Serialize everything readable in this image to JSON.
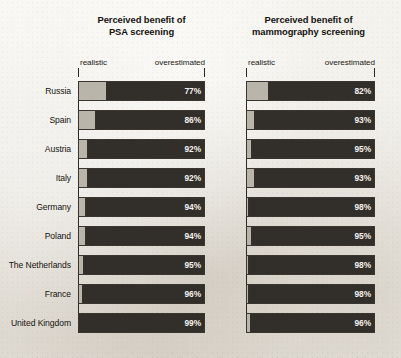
{
  "chart_data": {
    "type": "bar",
    "subtype": "paired horizontal 100% stacked bar",
    "title": "",
    "categories": [
      "Russia",
      "Spain",
      "Austria",
      "Italy",
      "Germany",
      "Poland",
      "The Netherlands",
      "France",
      "United Kingdom"
    ],
    "panels": [
      {
        "title_line1": "Perceived benefit of",
        "title_line2": "PSA screening",
        "left_axis_label": "realistic",
        "right_axis_label": "overestimated",
        "values": [
          77,
          86,
          92,
          92,
          94,
          94,
          95,
          96,
          99
        ],
        "value_labels": [
          "77%",
          "86%",
          "92%",
          "92%",
          "94%",
          "94%",
          "95%",
          "96%",
          "99%"
        ],
        "realistic_values": [
          23,
          14,
          8,
          8,
          6,
          6,
          5,
          4,
          1
        ]
      },
      {
        "title_line1": "Perceived benefit of",
        "title_line2": "mammography screening",
        "left_axis_label": "realistic",
        "right_axis_label": "overestimated",
        "values": [
          82,
          93,
          95,
          93,
          98,
          95,
          98,
          98,
          96
        ],
        "value_labels": [
          "82%",
          "93%",
          "95%",
          "93%",
          "98%",
          "95%",
          "98%",
          "98%",
          "96%"
        ],
        "realistic_values": [
          18,
          7,
          5,
          7,
          2,
          5,
          2,
          2,
          4
        ]
      }
    ],
    "series": [
      {
        "name": "realistic",
        "color": "#b9b5ab"
      },
      {
        "name": "overestimated",
        "color": "#322e2a"
      }
    ],
    "xlabel": "",
    "ylabel": "",
    "xlim": [
      0,
      100
    ],
    "grid": false,
    "legend": "inline axis end labels"
  },
  "colors": {
    "background": "#edeae3",
    "realistic": "#b9b5ab",
    "overestimated": "#322e2a",
    "text": "#15130f",
    "value_text": "#f4f2ed",
    "axis": "#2d2924"
  }
}
